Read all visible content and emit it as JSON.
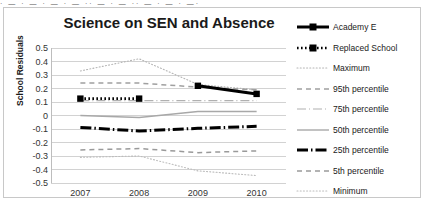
{
  "top_strip_text": "· — · —   · — ·    — ·· —    ·  —   ·· — ·  —  · —· ",
  "chart_data": {
    "type": "line",
    "title": "Science on SEN and Absence",
    "xlabel": "",
    "ylabel": "School Residuals",
    "categories": [
      "2007",
      "2008",
      "2009",
      "2010"
    ],
    "ylim": [
      -0.5,
      0.5
    ],
    "ytick_values": [
      "0.5",
      "0.4",
      "0.3",
      "0.2",
      "0.1",
      "0",
      "-0.1",
      "-0.2",
      "-0.3",
      "-0.4",
      "-0.5"
    ],
    "grid": true,
    "legend_position": "right",
    "series": [
      {
        "name": "Academy E",
        "style": "thick-solid-marker",
        "color": "#000000",
        "values": [
          null,
          null,
          0.22,
          0.16
        ]
      },
      {
        "name": "Replaced School",
        "style": "thick-dotted-marker",
        "color": "#000000",
        "values": [
          0.125,
          0.125,
          null,
          null
        ]
      },
      {
        "name": "Maximum",
        "style": "fine-dotted",
        "color": "#b4b4b4",
        "values": [
          0.33,
          0.42,
          0.23,
          0.19
        ]
      },
      {
        "name": "95th percentile",
        "style": "dashed",
        "color": "#a0a0a0",
        "values": [
          0.24,
          0.24,
          0.21,
          0.19
        ]
      },
      {
        "name": "75th percentile",
        "style": "solid-thin-dashdot",
        "color": "#b0b0b0",
        "values": [
          0.11,
          0.11,
          0.11,
          0.11
        ]
      },
      {
        "name": "50th percentile",
        "style": "solid-thin",
        "color": "#a8a8a8",
        "values": [
          0.0,
          -0.015,
          0.03,
          0.03
        ]
      },
      {
        "name": "25th percentile",
        "style": "thick-dashdot",
        "color": "#000000",
        "values": [
          -0.088,
          -0.115,
          -0.095,
          -0.08
        ]
      },
      {
        "name": "5th percentile",
        "style": "dashed",
        "color": "#9a9a9a",
        "values": [
          -0.255,
          -0.245,
          -0.275,
          -0.262
        ]
      },
      {
        "name": "Minimum",
        "style": "fine-dotted",
        "color": "#bcbcbc",
        "values": [
          -0.31,
          -0.3,
          -0.41,
          -0.445
        ]
      }
    ]
  }
}
